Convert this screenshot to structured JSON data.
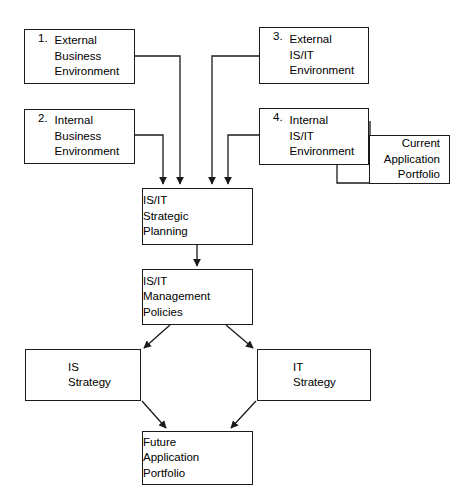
{
  "diagram": {
    "style": {
      "line_color": "#1a1a1a",
      "text_color": "#000000",
      "background": "#ffffff"
    },
    "nodes": {
      "external_business": {
        "number": "1.",
        "line1": "External",
        "line2": "Business",
        "line3": "Environment"
      },
      "internal_business": {
        "number": "2.",
        "line1": "Internal",
        "line2": "Business",
        "line3": "Environment"
      },
      "external_isit": {
        "number": "3.",
        "line1": "External",
        "line2": "IS/IT",
        "line3": "Environment"
      },
      "internal_isit": {
        "number": "4.",
        "line1": "Internal",
        "line2": "IS/IT",
        "line3": "Environment"
      },
      "current_application_portfolio": {
        "line1": "Current",
        "line2": "Application",
        "line3": "Portfolio"
      },
      "strategic_planning": {
        "line1": "IS/IT",
        "line2": "Strategic",
        "line3": "Planning"
      },
      "management_policies": {
        "line1": "IS/IT",
        "line2": "Management",
        "line3": "Policies"
      },
      "is_strategy": {
        "line1": "IS",
        "line2": "Strategy"
      },
      "it_strategy": {
        "line1": "IT",
        "line2": "Strategy"
      },
      "future_application_portfolio": {
        "line1": "Future",
        "line2": "Application",
        "line3": "Portfolio"
      }
    }
  }
}
